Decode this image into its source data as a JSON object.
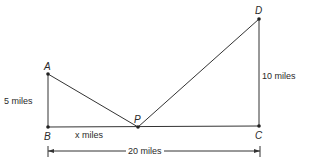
{
  "diagram": {
    "points": {
      "A": {
        "label": "A",
        "x": 48,
        "y": 74
      },
      "B": {
        "label": "B",
        "x": 48,
        "y": 127
      },
      "P": {
        "label": "P",
        "x": 138,
        "y": 127
      },
      "C": {
        "label": "C",
        "x": 259,
        "y": 126
      },
      "D": {
        "label": "D",
        "x": 259,
        "y": 19
      }
    },
    "labels": {
      "AB": "5 miles",
      "BP": "x miles",
      "CD": "10 miles",
      "BC": "20 miles"
    }
  }
}
